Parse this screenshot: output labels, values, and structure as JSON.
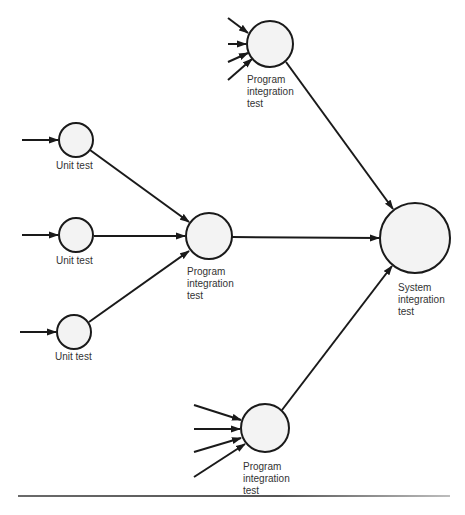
{
  "diagram": {
    "type": "flow",
    "colors": {
      "stroke": "#1a1a1a",
      "node_fill": "#f3f3f3",
      "text": "#333333"
    },
    "nodes": [
      {
        "id": "unit1",
        "label": "Unit test"
      },
      {
        "id": "unit2",
        "label": "Unit test"
      },
      {
        "id": "unit3",
        "label": "Unit test"
      },
      {
        "id": "prog_mid",
        "label": "Program\nintegration\ntest"
      },
      {
        "id": "prog_top",
        "label": "Program\nintegration\ntest"
      },
      {
        "id": "prog_bot",
        "label": "Program\nintegration\ntest"
      },
      {
        "id": "system",
        "label": "System\nintegration\ntest"
      }
    ],
    "edges": [
      {
        "from": "external",
        "to": "unit1"
      },
      {
        "from": "external",
        "to": "unit2"
      },
      {
        "from": "external",
        "to": "unit3"
      },
      {
        "from": "unit1",
        "to": "prog_mid"
      },
      {
        "from": "unit2",
        "to": "prog_mid"
      },
      {
        "from": "unit3",
        "to": "prog_mid"
      },
      {
        "from": "external",
        "to": "prog_top",
        "count": 4
      },
      {
        "from": "external",
        "to": "prog_bot",
        "count": 4
      },
      {
        "from": "prog_top",
        "to": "system"
      },
      {
        "from": "prog_mid",
        "to": "system"
      },
      {
        "from": "prog_bot",
        "to": "system"
      }
    ]
  },
  "labels": {
    "unit1": "Unit test",
    "unit2": "Unit test",
    "unit3": "Unit test",
    "prog_mid": "Program\nintegration\ntest",
    "prog_top": "Program\nintegration\ntest",
    "prog_bot": "Program\nintegration\ntest",
    "system": "System\nintegration\ntest"
  }
}
